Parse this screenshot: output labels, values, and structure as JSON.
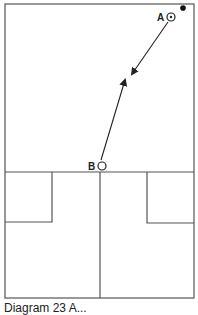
{
  "diagram": {
    "type": "court-play-diagram",
    "colors": {
      "line": "#555555",
      "ink": "#222222",
      "background": "#ffffff"
    },
    "players": [
      {
        "label": "A",
        "marker": "circle-with-dot",
        "x": 171,
        "y": 17
      },
      {
        "label": "B",
        "marker": "open-circle",
        "x": 102,
        "y": 166
      }
    ],
    "ball": {
      "marker": "filled-dot",
      "x": 183,
      "y": 8
    },
    "arrows": [
      {
        "from": "A",
        "direction": "toward-center",
        "x1": 168,
        "y1": 22,
        "x2": 132,
        "y2": 74
      },
      {
        "from": "B",
        "direction": "toward-center",
        "x1": 101,
        "y1": 160,
        "x2": 125,
        "y2": 80
      }
    ]
  },
  "caption": "Diagram 23 A..."
}
